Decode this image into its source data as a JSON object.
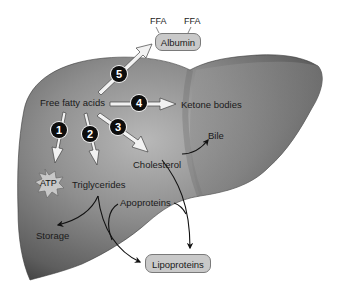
{
  "diagram": {
    "organ": "liver",
    "colors": {
      "liver_dark": "#4a4a4a",
      "liver_mid": "#8c8c8c",
      "liver_light": "#b5b5b5",
      "pill_fill": "#c9c9c9",
      "number_badge": "#0d0d0d",
      "arrow_fill": "#f2f2f2"
    },
    "nodes": {
      "ffa_left": "FFA",
      "ffa_right": "FFA",
      "albumin": "Albumin",
      "free_fatty_acids": "Free fatty acids",
      "ketone_bodies": "Ketone bodies",
      "bile": "Bile",
      "cholesterol": "Cholesterol",
      "atp": "ATP",
      "triglycerides": "Triglycerides",
      "apoproteins": "Apoproteins",
      "storage": "Storage",
      "lipoproteins": "Lipoproteins"
    },
    "pathways": [
      {
        "number": "1",
        "from": "Free fatty acids",
        "to": "ATP"
      },
      {
        "number": "2",
        "from": "Free fatty acids",
        "to": "Triglycerides"
      },
      {
        "number": "3",
        "from": "Free fatty acids",
        "to": "Cholesterol"
      },
      {
        "number": "4",
        "from": "Free fatty acids",
        "to": "Ketone bodies"
      },
      {
        "number": "5",
        "from": "Free fatty acids",
        "to": "Albumin"
      }
    ],
    "secondary_links": [
      {
        "from": "Cholesterol",
        "to": "Bile"
      },
      {
        "from": "Cholesterol",
        "to": "Lipoproteins"
      },
      {
        "from": "Triglycerides",
        "to": "Storage"
      },
      {
        "from": "Triglycerides",
        "to": "Lipoproteins"
      },
      {
        "from": "Apoproteins",
        "to": "Lipoproteins"
      }
    ]
  }
}
